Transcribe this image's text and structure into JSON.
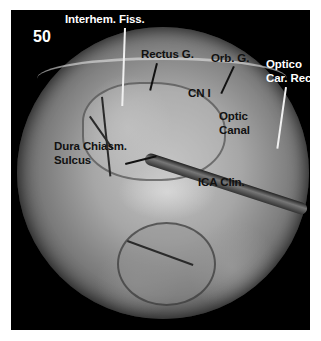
{
  "figure": {
    "number": "50",
    "type": "endoscopic surgical photograph",
    "labels": [
      {
        "id": "interhem",
        "text": "Interhem. Fiss.",
        "color": "white"
      },
      {
        "id": "rectus",
        "text": "Rectus G.",
        "color": "black"
      },
      {
        "id": "orb",
        "text": "Orb. G.",
        "color": "black"
      },
      {
        "id": "optico_1",
        "text": "Optico",
        "color": "white"
      },
      {
        "id": "optico_2",
        "text": "Car. Rec.",
        "color": "white"
      },
      {
        "id": "cn1",
        "text": "CN I",
        "color": "black"
      },
      {
        "id": "optic_1",
        "text": "Optic",
        "color": "black"
      },
      {
        "id": "optic_2",
        "text": "Canal",
        "color": "black"
      },
      {
        "id": "dura_1",
        "text": "Dura Chiasm.",
        "color": "black"
      },
      {
        "id": "dura_2",
        "text": "Sulcus",
        "color": "black"
      },
      {
        "id": "ica",
        "text": "ICA Clin.",
        "color": "black"
      }
    ]
  }
}
